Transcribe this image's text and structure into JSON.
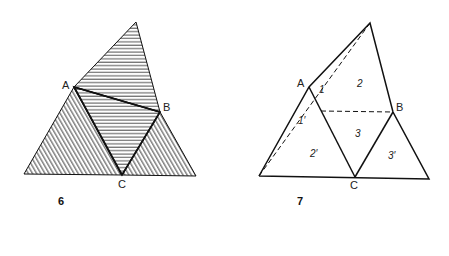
{
  "figure6": {
    "number": "6",
    "labels": {
      "A": "A",
      "B": "B",
      "C": "C"
    },
    "description": "Triangle divided by segments AB, AC, BC; top and middle regions hatched horizontally, corner regions hatched diagonally"
  },
  "figure7": {
    "number": "7",
    "labels": {
      "A": "A",
      "B": "B",
      "C": "C"
    },
    "regions": [
      "1",
      "2",
      "3",
      "1′",
      "2′",
      "3′"
    ],
    "description": "Triangle unfolded into regions with dashed fold lines"
  },
  "colors": {
    "line": "#111111",
    "background": "#ffffff"
  }
}
